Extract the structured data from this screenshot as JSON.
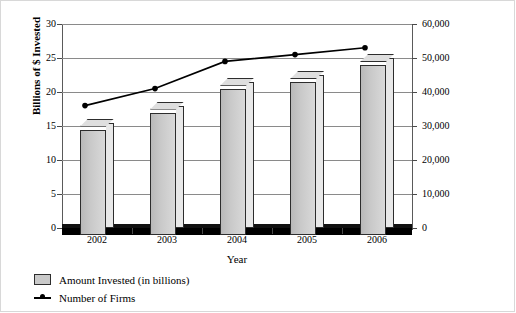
{
  "chart_data": {
    "type": "bar",
    "title": "",
    "xlabel": "Year",
    "categories": [
      "2002",
      "2003",
      "2004",
      "2005",
      "2006"
    ],
    "series": [
      {
        "name": "Amount Invested (in billions)",
        "type": "bar",
        "axis": "left",
        "values": [
          15.5,
          18.0,
          21.5,
          22.5,
          25.0
        ]
      },
      {
        "name": "Number of Firms",
        "type": "line",
        "axis": "right",
        "values": [
          36000,
          41000,
          49000,
          51000,
          53000
        ]
      }
    ],
    "left_axis": {
      "label": "Billions of $ Invested",
      "ylim": [
        0,
        30
      ],
      "ticks": [
        "0",
        "5",
        "10",
        "15",
        "20",
        "25",
        "30"
      ],
      "tick_values": [
        0,
        5,
        10,
        15,
        20,
        25,
        30
      ]
    },
    "right_axis": {
      "label": "Number of Small Companies",
      "ylim": [
        0,
        60000
      ],
      "ticks": [
        "0",
        "10,000",
        "20,000",
        "30,000",
        "40,000",
        "50,000",
        "60,000"
      ],
      "tick_values": [
        0,
        10000,
        20000,
        30000,
        40000,
        50000,
        60000
      ]
    },
    "grid": true,
    "legend_position": "bottom-left",
    "colors": {
      "bar_face": "#c9c9c9",
      "bar_outline": "#2d2d2d",
      "line": "#000000",
      "gridline": "#8a8a8a",
      "background": "#ffffff"
    }
  },
  "legend": {
    "items": [
      {
        "label": "Amount Invested (in billions)",
        "marker": "square-swatch"
      },
      {
        "label": "Number of Firms",
        "marker": "line-dot"
      }
    ]
  }
}
